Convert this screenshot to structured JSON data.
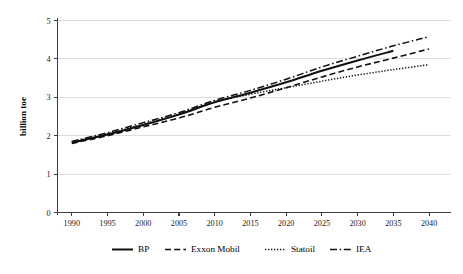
{
  "chart_data": {
    "type": "line",
    "title": "",
    "xlabel": "",
    "ylabel": "billion toe",
    "xlim": [
      1988,
      2043
    ],
    "ylim": [
      0,
      5
    ],
    "grid": "horizontal",
    "legend_position": "bottom",
    "x_ticks": [
      "1990",
      "1995",
      "2000",
      "2005",
      "2010",
      "2015",
      "2020",
      "2025",
      "2030",
      "2035",
      "2040"
    ],
    "y_ticks": [
      "0",
      "1",
      "2",
      "3",
      "4",
      "5"
    ],
    "series": [
      {
        "name": "BP",
        "style": "solid",
        "x": [
          1990,
          1995,
          2000,
          2005,
          2010,
          2015,
          2020,
          2025,
          2030,
          2035
        ],
        "values": [
          1.82,
          2.03,
          2.28,
          2.55,
          2.87,
          3.12,
          3.39,
          3.69,
          3.96,
          4.21
        ]
      },
      {
        "name": "Exxon Mobil",
        "style": "dashed",
        "x": [
          1990,
          1995,
          2000,
          2005,
          2010,
          2015,
          2020,
          2025,
          2030,
          2035,
          2040
        ],
        "values": [
          1.8,
          2.0,
          2.23,
          2.46,
          2.74,
          2.98,
          3.25,
          3.53,
          3.79,
          4.02,
          4.26
        ]
      },
      {
        "name": "Statoil",
        "style": "dotted",
        "x": [
          1990,
          1995,
          2000,
          2005,
          2010,
          2015,
          2020,
          2025,
          2030,
          2035,
          2040
        ],
        "values": [
          1.83,
          2.05,
          2.3,
          2.57,
          2.88,
          3.08,
          3.25,
          3.42,
          3.58,
          3.72,
          3.85
        ]
      },
      {
        "name": "IEA",
        "style": "dashdot",
        "x": [
          1990,
          1995,
          2000,
          2005,
          2010,
          2015,
          2020,
          2025,
          2030,
          2035,
          2040
        ],
        "values": [
          1.85,
          2.08,
          2.34,
          2.6,
          2.92,
          3.18,
          3.47,
          3.79,
          4.07,
          4.34,
          4.58
        ]
      }
    ]
  },
  "legend": {
    "items": [
      {
        "label": "BP",
        "style": "solid"
      },
      {
        "label": "Exxon Mobil",
        "style": "dashed"
      },
      {
        "label": "Statoil",
        "style": "dotted"
      },
      {
        "label": "IEA",
        "style": "dashdot"
      }
    ]
  }
}
